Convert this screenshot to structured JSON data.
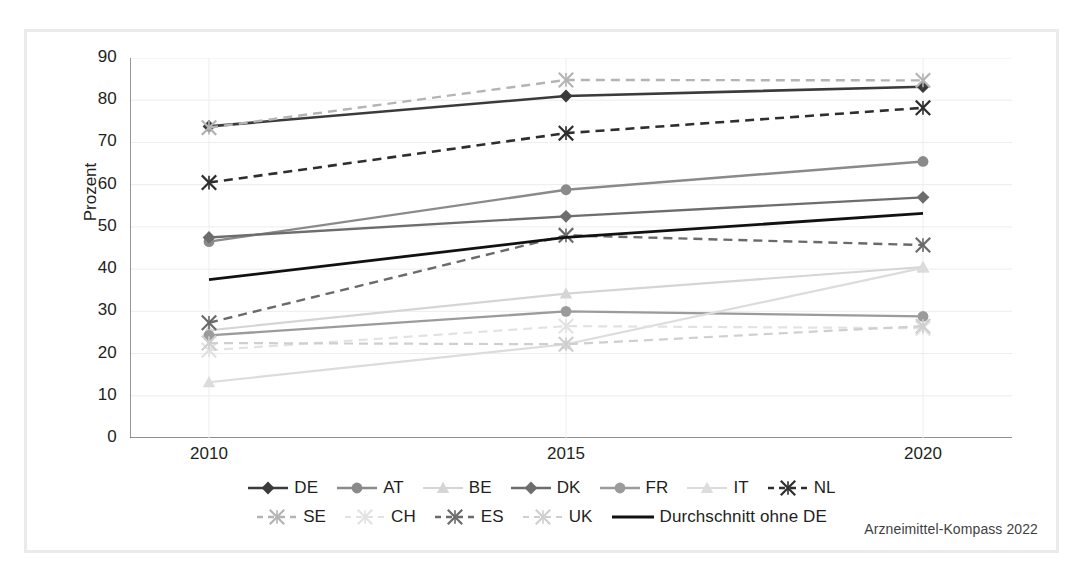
{
  "figure": {
    "caption": "Arzneimittel-Kompass 2022",
    "border_color": "#ebebeb",
    "background": "#ffffff"
  },
  "chart_data": {
    "type": "line",
    "title": "",
    "xlabel": "",
    "ylabel": "Prozent",
    "categories": [
      "2010",
      "2015",
      "2020"
    ],
    "x": [
      2010,
      2015,
      2020
    ],
    "ylim": [
      0,
      90
    ],
    "ytick_step": 10,
    "yticks": [
      "90",
      "80",
      "70",
      "60",
      "50",
      "40",
      "30",
      "20",
      "10",
      "0"
    ],
    "grid": "horizontal-and-vertical",
    "legend_position": "bottom",
    "series": [
      {
        "name": "DE",
        "values": [
          73.8,
          81.0,
          83.2
        ],
        "color": "#3b3b3b",
        "dash": "solid",
        "marker": "diamond",
        "width": 2.6
      },
      {
        "name": "AT",
        "values": [
          46.5,
          58.8,
          65.5
        ],
        "color": "#8a8a8a",
        "dash": "solid",
        "marker": "circle",
        "width": 2.4
      },
      {
        "name": "BE",
        "values": [
          25.5,
          34.2,
          40.5
        ],
        "color": "#d5d5d5",
        "dash": "solid",
        "marker": "triangle",
        "width": 2.2
      },
      {
        "name": "DK",
        "values": [
          47.5,
          52.5,
          57.0
        ],
        "color": "#6d6d6d",
        "dash": "solid",
        "marker": "diamond",
        "width": 2.4
      },
      {
        "name": "FR",
        "values": [
          24.3,
          30.0,
          28.8
        ],
        "color": "#9b9b9b",
        "dash": "solid",
        "marker": "circle",
        "width": 2.4
      },
      {
        "name": "IT",
        "values": [
          13.2,
          22.2,
          40.3
        ],
        "color": "#dcdcdc",
        "dash": "solid",
        "marker": "triangle",
        "width": 2.2
      },
      {
        "name": "NL",
        "values": [
          60.5,
          72.2,
          78.2
        ],
        "color": "#2e2e2e",
        "dash": "dashed",
        "marker": "asterisk",
        "width": 2.6
      },
      {
        "name": "SE",
        "values": [
          73.5,
          84.8,
          84.7
        ],
        "color": "#b4b4b4",
        "dash": "dashed",
        "marker": "asterisk",
        "width": 2.4
      },
      {
        "name": "CH",
        "values": [
          20.8,
          26.5,
          26.0
        ],
        "color": "#e2e2e2",
        "dash": "dashed",
        "marker": "asterisk",
        "width": 2.2
      },
      {
        "name": "ES",
        "values": [
          27.3,
          48.0,
          45.7
        ],
        "color": "#6a6a6a",
        "dash": "dashed",
        "marker": "asterisk",
        "width": 2.4
      },
      {
        "name": "UK",
        "values": [
          22.5,
          22.2,
          26.5
        ],
        "color": "#cfcfcf",
        "dash": "dashed",
        "marker": "asterisk",
        "width": 2.2
      },
      {
        "name": "Durchschnitt ohne DE",
        "values": [
          37.5,
          47.5,
          53.2
        ],
        "color": "#111111",
        "dash": "solid",
        "marker": "none",
        "width": 2.8
      }
    ]
  },
  "legend": {
    "rows": [
      [
        "DE",
        "AT",
        "BE",
        "DK",
        "FR",
        "IT",
        "NL"
      ],
      [
        "SE",
        "CH",
        "ES",
        "UK",
        "Durchschnitt ohne DE"
      ]
    ]
  }
}
